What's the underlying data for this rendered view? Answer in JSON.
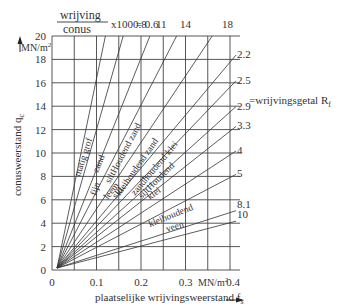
{
  "chart_data": {
    "type": "line",
    "title": "",
    "xlabel": "plaatselijke wrijvingsweerstand f_s",
    "xunit": "MN/m²",
    "ylabel": "conusweerstand q_c",
    "yunit": "MN/m²",
    "xlim": [
      0,
      0.4
    ],
    "ylim": [
      0,
      20
    ],
    "grid": true,
    "x_ticks": [
      "0",
      "0.1",
      "0.2",
      "0.3",
      "0.4"
    ],
    "y_ticks": [
      "0",
      "2",
      "4",
      "6",
      "8",
      "10",
      "12",
      "14",
      "16",
      "18",
      "20"
    ],
    "top_header": {
      "fraction_numerator": "wrijving",
      "fraction_denominator": "conus",
      "suffix": "x100 =",
      "labels": [
        "0.6",
        "0.8",
        "11",
        "14",
        "18"
      ]
    },
    "right_labels": [
      "2.2",
      "2.5",
      "2.9",
      "3.3",
      "4",
      "5",
      "8.1",
      "10"
    ],
    "right_caption": "=wrijvingsgetal R",
    "right_caption_sub": "f",
    "series_note": "Rays from origin; q_c = 100·f_s / R_f",
    "series": [
      {
        "name": "R_f 0.6",
        "rf": 0.6,
        "end": {
          "fs": 0.12,
          "qc": 20
        }
      },
      {
        "name": "R_f 0.8",
        "rf": 0.8,
        "end": {
          "fs": 0.16,
          "qc": 20
        }
      },
      {
        "name": "R_f 1.1",
        "rf": 1.1,
        "end": {
          "fs": 0.22,
          "qc": 20
        }
      },
      {
        "name": "R_f 1.4",
        "rf": 1.4,
        "end": {
          "fs": 0.28,
          "qc": 20
        }
      },
      {
        "name": "R_f 1.8",
        "rf": 1.8,
        "end": {
          "fs": 0.36,
          "qc": 20
        }
      },
      {
        "name": "R_f 2.2",
        "rf": 2.2,
        "end": {
          "fs": 0.4,
          "qc": 18.2
        }
      },
      {
        "name": "R_f 2.5",
        "rf": 2.5,
        "end": {
          "fs": 0.4,
          "qc": 16
        }
      },
      {
        "name": "R_f 2.9",
        "rf": 2.9,
        "end": {
          "fs": 0.4,
          "qc": 13.8
        }
      },
      {
        "name": "R_f 3.3",
        "rf": 3.3,
        "end": {
          "fs": 0.4,
          "qc": 12.1
        }
      },
      {
        "name": "R_f 4",
        "rf": 4,
        "end": {
          "fs": 0.4,
          "qc": 10
        }
      },
      {
        "name": "R_f 5",
        "rf": 5,
        "end": {
          "fs": 0.4,
          "qc": 8
        }
      },
      {
        "name": "R_f 8.1",
        "rf": 8.1,
        "end": {
          "fs": 0.4,
          "qc": 4.9
        }
      },
      {
        "name": "R_f 10",
        "rf": 10,
        "end": {
          "fs": 0.4,
          "qc": 4
        }
      }
    ],
    "soil_zone_labels": [
      "matig grof",
      "fijn",
      "zand",
      "siltHoudend zand",
      "kleihoudend zand",
      "zandhoudend klei",
      "siltHoudend",
      "leem",
      "silt",
      "klei",
      "kleihoudend",
      "veen"
    ]
  },
  "labels": {
    "frac_num": "wrijving",
    "frac_den": "conus",
    "frac_suffix": "x100 = 0.6",
    "top_0_8": "0.8",
    "top_11": "11",
    "top_14": "14",
    "top_18": "18",
    "y_unit": "MN/m",
    "y_title": "conusweerstand q",
    "y_title_sub": "c",
    "x_title": "plaatselijke wrijvingsweerstand f",
    "x_title_sub": "s",
    "x_unit": "MN/m",
    "rf_caption": "=wrijvingsgetal R",
    "rf_caption_sub": "f",
    "zone_matig_grof": "matig grof",
    "zone_fijn": "fijn",
    "zone_zand": "zand",
    "zone_silth_zand": "siltHoudend zand",
    "zone_kleih_zand": "kleihoudend zand",
    "zone_zandh_klei": "zandhoudend klei",
    "zone_silth": "siltHoudend",
    "zone_leem": "leem",
    "zone_silt": "silt",
    "zone_klei": "klei",
    "zone_kleihoudend": "kleihoudend",
    "zone_veen": "veen"
  }
}
